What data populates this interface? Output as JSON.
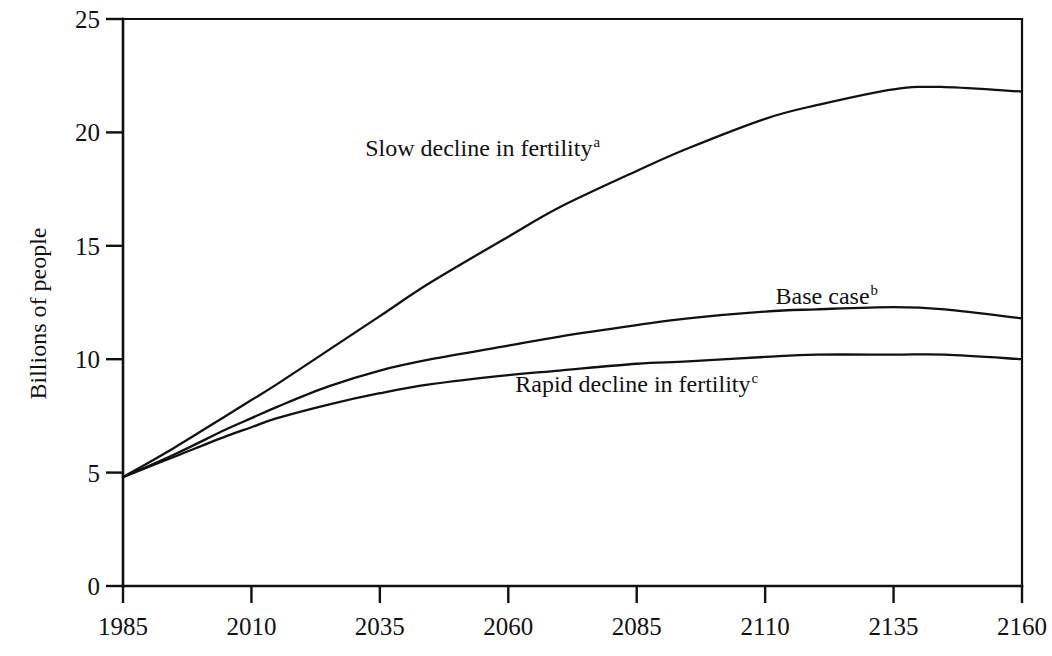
{
  "chart_data": {
    "type": "line",
    "title": "",
    "subtitle": "",
    "xlabel": "",
    "ylabel": "Billions of people",
    "xlim": [
      1985,
      2160
    ],
    "ylim": [
      0,
      25
    ],
    "grid": false,
    "legend_position": "inline-annotations",
    "x_ticks": [
      "1985",
      "2010",
      "2035",
      "2060",
      "2085",
      "2110",
      "2135",
      "2160"
    ],
    "x_tick_values": [
      1985,
      2010,
      2035,
      2060,
      2085,
      2110,
      2135,
      2160
    ],
    "y_ticks": [
      "0",
      "5",
      "10",
      "15",
      "20",
      "25"
    ],
    "y_tick_values": [
      0,
      5,
      10,
      15,
      20,
      25
    ],
    "x": [
      1985,
      1995,
      2005,
      2010,
      2015,
      2025,
      2035,
      2045,
      2060,
      2070,
      2085,
      2095,
      2110,
      2120,
      2135,
      2145,
      2160
    ],
    "series": [
      {
        "name": "Slow decline in fertility",
        "footnote": "a",
        "label_x": 2055,
        "label_y": 19.3,
        "values": [
          4.8,
          6.1,
          7.5,
          8.2,
          8.9,
          10.4,
          11.9,
          13.4,
          15.4,
          16.7,
          18.3,
          19.3,
          20.6,
          21.2,
          21.9,
          22.0,
          21.8
        ]
      },
      {
        "name": "Base case",
        "footnote": "b",
        "label_x": 2122,
        "label_y": 12.8,
        "values": [
          4.8,
          5.8,
          6.9,
          7.4,
          7.9,
          8.8,
          9.5,
          10.0,
          10.6,
          11.0,
          11.5,
          11.8,
          12.1,
          12.2,
          12.3,
          12.2,
          11.8
        ]
      },
      {
        "name": "Rapid decline in fertility",
        "footnote": "c",
        "label_x": 2085,
        "label_y": 8.9,
        "values": [
          4.8,
          5.7,
          6.6,
          7.0,
          7.4,
          8.0,
          8.5,
          8.9,
          9.3,
          9.5,
          9.8,
          9.9,
          10.1,
          10.2,
          10.2,
          10.2,
          10.0
        ]
      }
    ]
  }
}
